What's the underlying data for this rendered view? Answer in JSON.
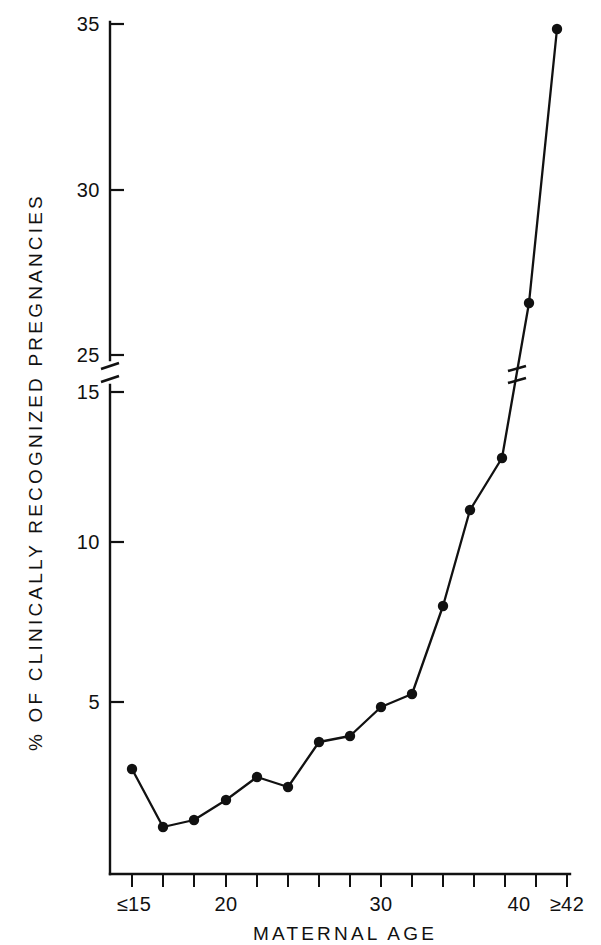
{
  "chart_data": {
    "type": "line",
    "title": "",
    "xlabel": "MATERNAL AGE",
    "ylabel": "% OF CLINICALLY RECOGNIZED PREGNANCIES",
    "x": [
      15,
      17,
      18,
      20,
      22,
      24,
      26,
      28,
      30,
      32,
      34,
      36,
      38,
      39,
      41,
      42
    ],
    "values": [
      3.2,
      1.5,
      1.7,
      2.2,
      3.0,
      2.8,
      4.1,
      4.3,
      5.2,
      5.6,
      8.1,
      11.2,
      13.0,
      24.6,
      26.0,
      34.8
    ],
    "categories": [
      "≤15",
      "17",
      "18",
      "20",
      "22",
      "24",
      "26",
      "28",
      "30",
      "32",
      "34",
      "36",
      "38",
      "39",
      "41",
      "≥42"
    ],
    "xtick_labels": [
      "≤15",
      "20",
      "30",
      "40",
      "≥42"
    ],
    "xtick_values": [
      15,
      20,
      30,
      40,
      42
    ],
    "xlim": [
      15,
      42
    ],
    "ytick_labels": [
      "5",
      "10",
      "15",
      "25",
      "30",
      "35"
    ],
    "ytick_values": [
      5,
      10,
      15,
      25,
      30,
      35
    ],
    "ylim": [
      0,
      35
    ],
    "axis_break": {
      "present": true,
      "between": [
        15,
        25
      ],
      "note": "y-axis broken between 15 and 25"
    },
    "grid": false,
    "legend": "none",
    "marker": "filled-circle",
    "line_color": "#111111",
    "marker_color": "#111111",
    "background_color": "#ffffff"
  },
  "axes": {
    "y_label": "% OF CLINICALLY RECOGNIZED PREGNANCIES",
    "x_label": "MATERNAL AGE",
    "y_ticks": [
      {
        "label": "35",
        "y": 24
      },
      {
        "label": "30",
        "y": 190
      },
      {
        "label": "25",
        "y": 355
      },
      {
        "label": "15",
        "y": 392
      },
      {
        "label": "10",
        "y": 542
      },
      {
        "label": "5",
        "y": 702
      }
    ],
    "x_ticks": [
      {
        "label": "≤15",
        "x": 132
      },
      {
        "label": "",
        "x": 163
      },
      {
        "label": "",
        "x": 194
      },
      {
        "label": "20",
        "x": 226
      },
      {
        "label": "",
        "x": 257
      },
      {
        "label": "",
        "x": 288
      },
      {
        "label": "",
        "x": 319
      },
      {
        "label": "",
        "x": 350
      },
      {
        "label": "30",
        "x": 381
      },
      {
        "label": "",
        "x": 412
      },
      {
        "label": "",
        "x": 443
      },
      {
        "label": "",
        "x": 474
      },
      {
        "label": "",
        "x": 505
      },
      {
        "label": "40",
        "x": 528
      },
      {
        "label": "≥42",
        "x": 557
      }
    ]
  },
  "points_px": [
    {
      "x": 132,
      "y": 769
    },
    {
      "x": 163,
      "y": 827
    },
    {
      "x": 194,
      "y": 820
    },
    {
      "x": 226,
      "y": 800
    },
    {
      "x": 257,
      "y": 777
    },
    {
      "x": 288,
      "y": 787
    },
    {
      "x": 319,
      "y": 742
    },
    {
      "x": 350,
      "y": 736
    },
    {
      "x": 381,
      "y": 707
    },
    {
      "x": 412,
      "y": 694
    },
    {
      "x": 443,
      "y": 606
    },
    {
      "x": 470,
      "y": 510
    },
    {
      "x": 502,
      "y": 458
    },
    {
      "x": 529,
      "y": 303
    },
    {
      "x": 557,
      "y": 29
    }
  ]
}
